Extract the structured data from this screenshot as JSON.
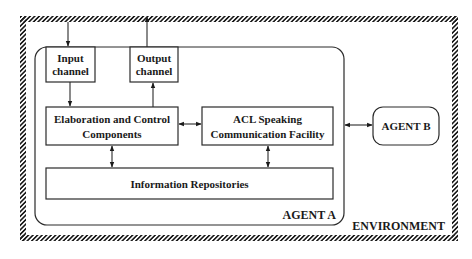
{
  "diagram": {
    "environment": {
      "label": "ENVIRONMENT"
    },
    "agent_a": {
      "label": "AGENT A"
    },
    "agent_b": {
      "label": "AGENT B"
    },
    "input_channel": {
      "line1": "Input",
      "line2": "channel"
    },
    "output_channel": {
      "line1": "Output",
      "line2": "channel"
    },
    "elaboration": {
      "line1": "Elaboration and Control",
      "line2": "Components"
    },
    "acl": {
      "line1": "ACL Speaking",
      "line2": "Communication Facility"
    },
    "repositories": {
      "label": "Information Repositories"
    },
    "connections": [
      {
        "from": "environment",
        "to": "input_channel",
        "direction": "one-way"
      },
      {
        "from": "output_channel",
        "to": "environment",
        "direction": "one-way"
      },
      {
        "from": "input_channel",
        "to": "elaboration",
        "direction": "one-way"
      },
      {
        "from": "elaboration",
        "to": "output_channel",
        "direction": "one-way"
      },
      {
        "from": "elaboration",
        "to": "acl",
        "direction": "two-way"
      },
      {
        "from": "acl",
        "to": "agent_b",
        "direction": "two-way"
      },
      {
        "from": "elaboration",
        "to": "repositories",
        "direction": "two-way"
      },
      {
        "from": "acl",
        "to": "repositories",
        "direction": "two-way"
      }
    ]
  }
}
